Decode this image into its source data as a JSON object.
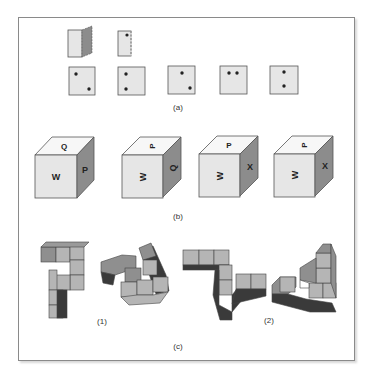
{
  "figure": {
    "panels": [
      {
        "id": "a",
        "label": "(a)",
        "description": "Folded paper with punched hole; choose the unfolded result",
        "fold_steps": [
          "paper-folded",
          "hole-punched"
        ],
        "options": [
          {
            "dots": [
              [
                0.3,
                0.3
              ],
              [
                0.75,
                0.75
              ]
            ]
          },
          {
            "dots": [
              [
                0.3,
                0.3
              ],
              [
                0.3,
                0.75
              ]
            ]
          },
          {
            "dots": [
              [
                0.5,
                0.3
              ],
              [
                0.75,
                0.75
              ]
            ]
          },
          {
            "dots": [
              [
                0.35,
                0.3
              ],
              [
                0.6,
                0.3
              ]
            ]
          },
          {
            "dots": [
              [
                0.5,
                0.3
              ],
              [
                0.5,
                0.75
              ]
            ]
          }
        ]
      },
      {
        "id": "b",
        "label": "(b)",
        "description": "Cube with lettered faces shown in different orientations",
        "cubes": [
          {
            "top": "Q",
            "front": "W",
            "side": "P",
            "top_rot": 0,
            "front_rot": 0,
            "side_rot": 0
          },
          {
            "top": "P",
            "front": "W",
            "side": "Q",
            "top_rot": -90,
            "front_rot": -90,
            "side_rot": -90
          },
          {
            "top": "P",
            "front": "W",
            "side": "X",
            "top_rot": 0,
            "front_rot": -90,
            "side_rot": 0
          },
          {
            "top": "P",
            "front": "W",
            "side": "X",
            "top_rot": -90,
            "front_rot": -90,
            "side_rot": 0
          }
        ]
      },
      {
        "id": "c",
        "label": "(c)",
        "description": "Pairs of block structures for mental rotation",
        "pairs": [
          {
            "label": "(1)"
          },
          {
            "label": "(2)"
          }
        ]
      }
    ],
    "colors": {
      "frame": "#8a8a8a",
      "face_light": "#e6e6e6",
      "face_top": "#f7f7f7",
      "face_side": "#8c8c8c",
      "block_light": "#b5b5b5",
      "block_mid": "#8f8f8f",
      "block_dark": "#3a3a3a",
      "dot": "#222222"
    }
  }
}
